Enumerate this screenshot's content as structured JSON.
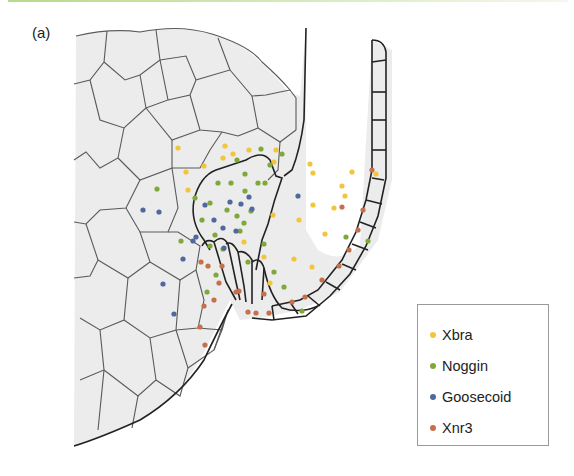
{
  "figure": {
    "panel_label": "(a)",
    "legend": [
      {
        "label": "Xbra",
        "color": "#f2c53d"
      },
      {
        "label": "Noggin",
        "color": "#7fa83a"
      },
      {
        "label": "Goosecoid",
        "color": "#50689e"
      },
      {
        "label": "Xnr3",
        "color": "#c4704a"
      }
    ],
    "colors": {
      "tissue_fill": "#ececec",
      "cell_border": "#555555",
      "heavy_border": "#222222",
      "accent_bar": "#b9d98a"
    },
    "dots": {
      "Xbra": [
        [
          178,
          148
        ],
        [
          225,
          146
        ],
        [
          223,
          158
        ],
        [
          233,
          154
        ],
        [
          188,
          190
        ],
        [
          204,
          166
        ],
        [
          249,
          150
        ],
        [
          276,
          150
        ],
        [
          274,
          162
        ],
        [
          310,
          164
        ],
        [
          186,
          172
        ],
        [
          313,
          173
        ],
        [
          342,
          186
        ],
        [
          313,
          205
        ],
        [
          352,
          172
        ],
        [
          273,
          215
        ],
        [
          345,
          196
        ],
        [
          325,
          234
        ],
        [
          312,
          267
        ],
        [
          376,
          174
        ],
        [
          294,
          259
        ],
        [
          264,
          257
        ],
        [
          299,
          220
        ],
        [
          334,
          208
        ],
        [
          270,
          283
        ],
        [
          244,
          242
        ]
      ],
      "Noggin": [
        [
          261,
          149
        ],
        [
          270,
          165
        ],
        [
          282,
          154
        ],
        [
          157,
          189
        ],
        [
          195,
          198
        ],
        [
          218,
          183
        ],
        [
          231,
          183
        ],
        [
          245,
          174
        ],
        [
          237,
          160
        ],
        [
          245,
          191
        ],
        [
          258,
          183
        ],
        [
          265,
          183
        ],
        [
          210,
          203
        ],
        [
          227,
          210
        ],
        [
          251,
          211
        ],
        [
          202,
          220
        ],
        [
          237,
          216
        ],
        [
          215,
          235
        ],
        [
          244,
          223
        ],
        [
          210,
          246
        ],
        [
          240,
          231
        ],
        [
          181,
          241
        ],
        [
          223,
          249
        ],
        [
          216,
          275
        ],
        [
          207,
          292
        ],
        [
          274,
          272
        ],
        [
          284,
          287
        ],
        [
          264,
          244
        ],
        [
          302,
          311
        ],
        [
          368,
          241
        ],
        [
          346,
          237
        ],
        [
          248,
          262
        ]
      ],
      "Goosecoid": [
        [
          205,
          205
        ],
        [
          230,
          202
        ],
        [
          249,
          197
        ],
        [
          214,
          220
        ],
        [
          223,
          228
        ],
        [
          241,
          204
        ],
        [
          236,
          231
        ],
        [
          196,
          237
        ],
        [
          224,
          248
        ],
        [
          252,
          209
        ],
        [
          298,
          196
        ],
        [
          143,
          210
        ],
        [
          159,
          212
        ],
        [
          183,
          259
        ],
        [
          163,
          284
        ],
        [
          174,
          314
        ],
        [
          193,
          241
        ]
      ],
      "Xnr3": [
        [
          372,
          170
        ],
        [
          363,
          210
        ],
        [
          358,
          230
        ],
        [
          349,
          250
        ],
        [
          339,
          266
        ],
        [
          322,
          280
        ],
        [
          305,
          297
        ],
        [
          292,
          302
        ],
        [
          201,
          262
        ],
        [
          208,
          266
        ],
        [
          222,
          266
        ],
        [
          219,
          283
        ],
        [
          214,
          300
        ],
        [
          204,
          306
        ],
        [
          200,
          327
        ],
        [
          205,
          345
        ],
        [
          264,
          294
        ],
        [
          256,
          313
        ],
        [
          239,
          291
        ],
        [
          236,
          292
        ],
        [
          248,
          312
        ],
        [
          269,
          313
        ],
        [
          342,
          207
        ]
      ]
    }
  }
}
